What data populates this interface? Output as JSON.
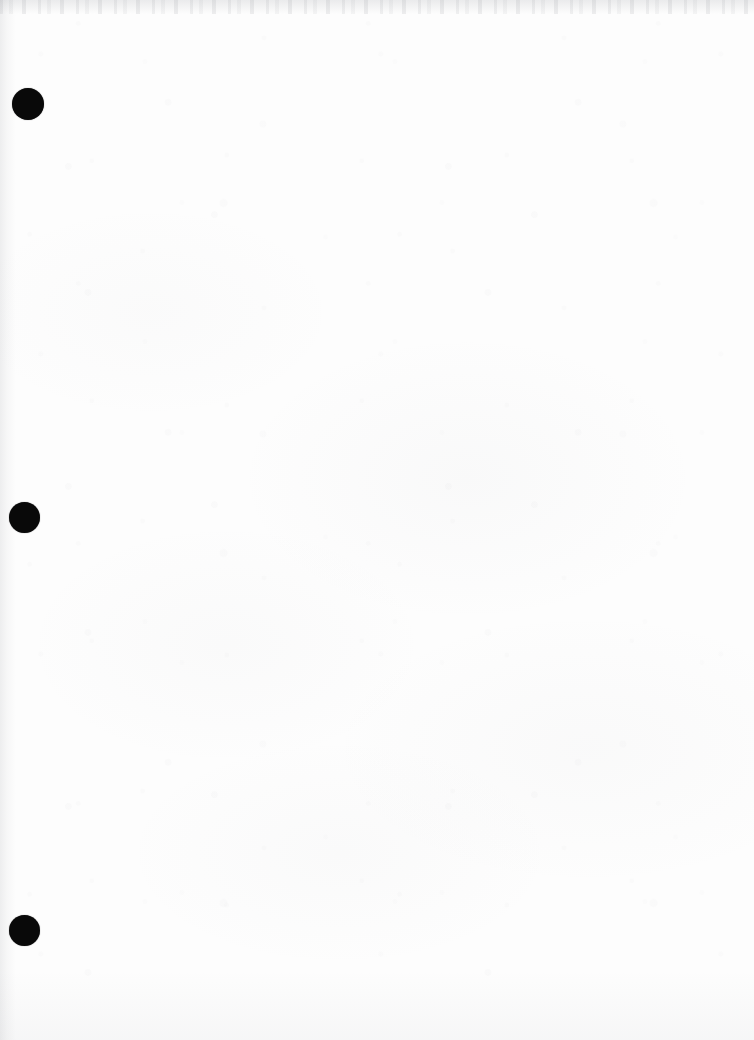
{
  "document": {
    "kind": "scanned-page",
    "page_state": "blank",
    "visible_text": "",
    "page_width": 754,
    "page_height": 1040,
    "paper_color": "#fdfdfd",
    "ink_color": "#090909"
  },
  "artifacts": {
    "top_edge_band": {
      "name": "scan-edge-speckle",
      "color": "#878a91"
    },
    "left_edge_shadow": {
      "name": "page-edge-shadow",
      "color": "#82858c"
    },
    "paper_texture": {
      "name": "paper-grain",
      "color": "#96969b"
    }
  },
  "punch_holes": [
    {
      "label": "top-punch-hole",
      "x": 12,
      "y": 88,
      "diameter": 32,
      "color": "#090909"
    },
    {
      "label": "middle-punch-hole",
      "x": 9,
      "y": 502,
      "diameter": 31,
      "color": "#090909"
    },
    {
      "label": "bottom-punch-hole",
      "x": 9,
      "y": 915,
      "diameter": 31,
      "color": "#090909"
    }
  ]
}
